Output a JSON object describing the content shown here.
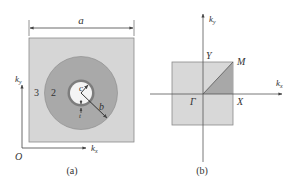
{
  "figure": {
    "colors": {
      "background": "#ffffff",
      "cell_fill": "#d6d6d6",
      "cell_stroke": "#8a8a8a",
      "annulus_fill": "#a9a9a9",
      "ring_fill": "#7d7d7d",
      "core_fill": "#f4f4f4",
      "bz_fill": "#d8d8d8",
      "ibz_fill": "#a8a8a8",
      "axis": "#555555",
      "text": "#333333"
    },
    "panel_a": {
      "caption": "(a)",
      "lattice_constant_label": "a",
      "region_labels": {
        "outer": "3",
        "middle": "2"
      },
      "radius_labels": {
        "inner": "c",
        "outer": "b",
        "thickness": "t"
      },
      "axes": {
        "x": "k",
        "x_sub": "x",
        "y": "k",
        "y_sub": "y",
        "origin": "O"
      }
    },
    "panel_b": {
      "caption": "(b)",
      "axes": {
        "x": "k",
        "x_sub": "x",
        "y": "k",
        "y_sub": "y"
      },
      "points": {
        "gamma": "Γ",
        "x": "X",
        "m": "M",
        "y": "Y"
      }
    }
  }
}
